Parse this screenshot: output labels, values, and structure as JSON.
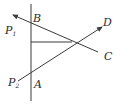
{
  "diagram": {
    "type": "geometry-ray-diagram",
    "stroke_color": "#3a3a3a",
    "labels": {
      "B": "B",
      "P1": "P",
      "P1_sub": "1",
      "D": "D",
      "C": "C",
      "P2": "P",
      "P2_sub": "2",
      "A": "A"
    },
    "lines": [
      {
        "name": "vertical-line",
        "from": [
          31,
          4
        ],
        "to": [
          31,
          101
        ]
      },
      {
        "name": "ray-C-to-P1",
        "from": [
          98,
          52
        ],
        "to": [
          13,
          15
        ],
        "arrow": "end"
      },
      {
        "name": "ray-P2-to-D",
        "from": [
          18,
          81
        ],
        "to": [
          102,
          27
        ],
        "arrow": "end"
      },
      {
        "name": "horizontal-segment",
        "from": [
          31,
          42
        ],
        "to": [
          72,
          42
        ]
      }
    ]
  }
}
